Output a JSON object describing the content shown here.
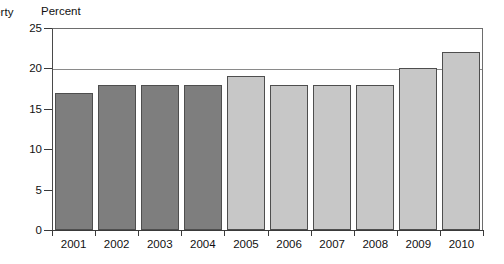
{
  "cut_caption": "erty",
  "axis_unit_label": "Percent",
  "colors": {
    "bar_dark": "#7e7e7e",
    "bar_light": "#c7c7c7",
    "bar_border": "#4e4e4e",
    "axis": "#3a3a3a",
    "grid": "#8a8a8a",
    "background": "#ffffff",
    "text": "#111111"
  },
  "chart_data": {
    "type": "bar",
    "title": "",
    "subtitle": "",
    "xlabel": "",
    "ylabel": "Percent",
    "categories": [
      "2001",
      "2002",
      "2003",
      "2004",
      "2005",
      "2006",
      "2007",
      "2008",
      "2009",
      "2010"
    ],
    "values": [
      17,
      18,
      18,
      18,
      19,
      18,
      18,
      18,
      20,
      22
    ],
    "bar_colors": [
      "dark",
      "dark",
      "dark",
      "dark",
      "light",
      "light",
      "light",
      "light",
      "light",
      "light"
    ],
    "ylim": [
      0,
      25
    ],
    "ytick_values": [
      0,
      5,
      10,
      15,
      20,
      25
    ],
    "ytick_labels": [
      "0",
      "5",
      "10",
      "15",
      "20",
      "25"
    ],
    "gridlines": [
      20,
      25
    ],
    "grid": true,
    "legend": null,
    "legend_position": "none",
    "annotations": []
  }
}
